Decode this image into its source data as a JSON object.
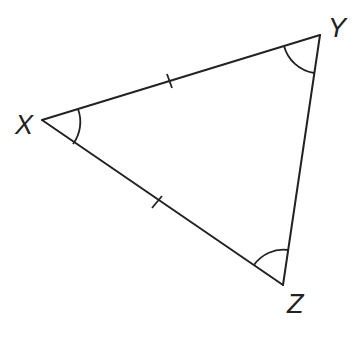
{
  "diagram": {
    "type": "triangle",
    "vertices": [
      {
        "label": "X",
        "x": 42,
        "y": 120,
        "label_x": 15,
        "label_y": 134
      },
      {
        "label": "Y",
        "x": 320,
        "y": 35,
        "label_x": 328,
        "label_y": 37
      },
      {
        "label": "Z",
        "x": 283,
        "y": 285,
        "label_x": 287,
        "label_y": 313
      }
    ],
    "edges": [
      {
        "from": "X",
        "to": "Y",
        "tick_marks": 1
      },
      {
        "from": "Y",
        "to": "Z",
        "tick_marks": 0
      },
      {
        "from": "Z",
        "to": "X",
        "tick_marks": 1
      }
    ],
    "angle_marks": [
      {
        "vertex": "X",
        "arcs": 1
      },
      {
        "vertex": "Y",
        "arcs": 1
      },
      {
        "vertex": "Z",
        "arcs": 1
      }
    ],
    "stroke_color": "#222222",
    "background_color": "#ffffff"
  },
  "labels": {
    "x": "X",
    "y": "Y",
    "z": "Z"
  }
}
